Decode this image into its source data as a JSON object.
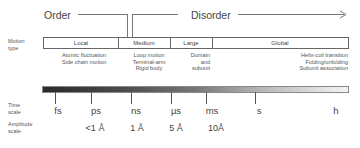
{
  "header": {
    "order_label": "Order",
    "disorder_label": "Disorder",
    "arrow_icon": "arrow-right-icon"
  },
  "row_labels": {
    "motion_type": [
      "Motion",
      "type"
    ],
    "time_scale": [
      "Time",
      "scale"
    ],
    "amplitude_scale": [
      "Amplitude",
      "scale"
    ]
  },
  "motion_types": [
    {
      "label": "Local",
      "description": [
        "Atomic fluctuation",
        "Side chain motion"
      ]
    },
    {
      "label": "Medium",
      "description": [
        "Loop motion",
        "Terminal-arm",
        "Rigid body"
      ]
    },
    {
      "label": "Large",
      "description": [
        "Domain",
        "and",
        "subunit"
      ]
    },
    {
      "label": "Global",
      "description": [
        "Helix-coil transition",
        "Folding/unfolding",
        "Subunit association"
      ]
    }
  ],
  "time_scale": {
    "gradient_start_color": "#2a2a2a",
    "gradient_end_color": "#f4f4f4",
    "ticks": [
      "fs",
      "ps",
      "ns",
      "µs",
      "ms",
      "s",
      "h"
    ]
  },
  "amplitude_scale": {
    "values": [
      "<1 Å",
      "1 Å",
      "5 Å",
      "10Å"
    ]
  }
}
